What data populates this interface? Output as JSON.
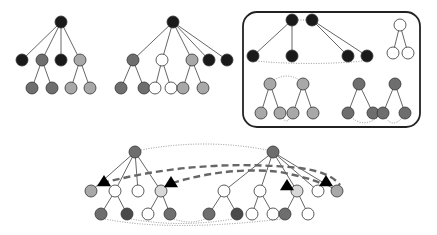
{
  "colors": {
    "black": "#1a1a1a",
    "dark": "#4a4a4a",
    "mid": "#6e6e6e",
    "light": "#a8a8a8",
    "pale": "#d8d8d8",
    "white": "#ffffff"
  },
  "diagram": {
    "tree1": {
      "nodes": [
        {
          "id": "r",
          "x": 61,
          "y": 22,
          "c": "black"
        },
        {
          "id": "a",
          "x": 22,
          "y": 60,
          "c": "black"
        },
        {
          "id": "b",
          "x": 42,
          "y": 60,
          "c": "mid"
        },
        {
          "id": "c",
          "x": 61,
          "y": 60,
          "c": "black"
        },
        {
          "id": "d",
          "x": 80,
          "y": 60,
          "c": "light"
        },
        {
          "id": "b1",
          "x": 32,
          "y": 88,
          "c": "mid"
        },
        {
          "id": "b2",
          "x": 52,
          "y": 88,
          "c": "mid"
        },
        {
          "id": "d1",
          "x": 71,
          "y": 88,
          "c": "light"
        },
        {
          "id": "d2",
          "x": 90,
          "y": 88,
          "c": "light"
        }
      ],
      "edges": [
        [
          "r",
          "a"
        ],
        [
          "r",
          "b"
        ],
        [
          "r",
          "c"
        ],
        [
          "r",
          "d"
        ],
        [
          "b",
          "b1"
        ],
        [
          "b",
          "b2"
        ],
        [
          "d",
          "d1"
        ],
        [
          "d",
          "d2"
        ]
      ]
    },
    "tree2": {
      "nodes": [
        {
          "id": "r",
          "x": 173,
          "y": 22,
          "c": "black"
        },
        {
          "id": "a",
          "x": 133,
          "y": 60,
          "c": "mid"
        },
        {
          "id": "b",
          "x": 162,
          "y": 60,
          "c": "white"
        },
        {
          "id": "c",
          "x": 192,
          "y": 60,
          "c": "light"
        },
        {
          "id": "d",
          "x": 209,
          "y": 60,
          "c": "black"
        },
        {
          "id": "e",
          "x": 227,
          "y": 60,
          "c": "black"
        },
        {
          "id": "a1",
          "x": 121,
          "y": 88,
          "c": "mid"
        },
        {
          "id": "a2",
          "x": 144,
          "y": 88,
          "c": "mid"
        },
        {
          "id": "b1",
          "x": 155,
          "y": 88,
          "c": "white"
        },
        {
          "id": "b2",
          "x": 171,
          "y": 88,
          "c": "white"
        },
        {
          "id": "c1",
          "x": 183,
          "y": 88,
          "c": "light"
        },
        {
          "id": "c2",
          "x": 203,
          "y": 88,
          "c": "light"
        }
      ],
      "edges": [
        [
          "r",
          "a"
        ],
        [
          "r",
          "b"
        ],
        [
          "r",
          "c"
        ],
        [
          "r",
          "d"
        ],
        [
          "r",
          "e"
        ],
        [
          "a",
          "a1"
        ],
        [
          "a",
          "a2"
        ],
        [
          "b",
          "b1"
        ],
        [
          "b",
          "b2"
        ],
        [
          "c",
          "c1"
        ],
        [
          "c",
          "c2"
        ]
      ]
    },
    "panel": {
      "box": {
        "x": 243,
        "y": 12,
        "w": 177,
        "h": 115,
        "r": 14
      },
      "nodes": [
        {
          "id": "p1",
          "x": 292,
          "y": 20,
          "c": "black"
        },
        {
          "id": "p2",
          "x": 312,
          "y": 20,
          "c": "black"
        },
        {
          "id": "q1",
          "x": 253,
          "y": 56,
          "c": "black"
        },
        {
          "id": "q2",
          "x": 292,
          "y": 56,
          "c": "black"
        },
        {
          "id": "q3",
          "x": 348,
          "y": 56,
          "c": "black"
        },
        {
          "id": "q4",
          "x": 367,
          "y": 56,
          "c": "black"
        },
        {
          "id": "w0",
          "x": 400,
          "y": 25,
          "c": "white"
        },
        {
          "id": "w1",
          "x": 393,
          "y": 53,
          "c": "white"
        },
        {
          "id": "w2",
          "x": 408,
          "y": 53,
          "c": "white"
        },
        {
          "id": "g1",
          "x": 270,
          "y": 84,
          "c": "light"
        },
        {
          "id": "g2",
          "x": 303,
          "y": 84,
          "c": "light"
        },
        {
          "id": "g11",
          "x": 261,
          "y": 113,
          "c": "light"
        },
        {
          "id": "g12",
          "x": 280,
          "y": 113,
          "c": "light"
        },
        {
          "id": "g21",
          "x": 293,
          "y": 113,
          "c": "light"
        },
        {
          "id": "g22",
          "x": 313,
          "y": 113,
          "c": "light"
        },
        {
          "id": "h1",
          "x": 359,
          "y": 84,
          "c": "mid"
        },
        {
          "id": "h2",
          "x": 395,
          "y": 84,
          "c": "mid"
        },
        {
          "id": "h11",
          "x": 348,
          "y": 113,
          "c": "mid"
        },
        {
          "id": "h12",
          "x": 373,
          "y": 113,
          "c": "mid"
        },
        {
          "id": "h21",
          "x": 383,
          "y": 113,
          "c": "mid"
        },
        {
          "id": "h22",
          "x": 405,
          "y": 113,
          "c": "mid"
        }
      ],
      "edges": [
        [
          "p1",
          "q1"
        ],
        [
          "p1",
          "q2"
        ],
        [
          "p2",
          "q3"
        ],
        [
          "p2",
          "q4"
        ],
        [
          "w0",
          "w1"
        ],
        [
          "w0",
          "w2"
        ],
        [
          "g1",
          "g11"
        ],
        [
          "g1",
          "g12"
        ],
        [
          "g2",
          "g21"
        ],
        [
          "g2",
          "g22"
        ],
        [
          "h1",
          "h11"
        ],
        [
          "h1",
          "h12"
        ],
        [
          "h2",
          "h21"
        ],
        [
          "h2",
          "h22"
        ]
      ],
      "dotted": [
        {
          "d": "M 298 20 L 306 20"
        },
        {
          "d": "M 256 61 Q 310 66 363 61"
        },
        {
          "d": "M 274 80 Q 287 72 299 80"
        },
        {
          "d": "M 283 118 Q 286 124 290 118"
        },
        {
          "d": "M 351 117 Q 363 128 377 118"
        },
        {
          "d": "M 386 118 Q 393 128 402 118"
        }
      ]
    },
    "bottom": {
      "nodes": [
        {
          "id": "R1",
          "x": 135,
          "y": 152,
          "c": "mid"
        },
        {
          "id": "R2",
          "x": 273,
          "y": 152,
          "c": "mid"
        },
        {
          "id": "a",
          "x": 91,
          "y": 191,
          "c": "light"
        },
        {
          "id": "b",
          "x": 115,
          "y": 191,
          "c": "white"
        },
        {
          "id": "c",
          "x": 138,
          "y": 191,
          "c": "white"
        },
        {
          "id": "d",
          "x": 161,
          "y": 191,
          "c": "pale"
        },
        {
          "id": "e",
          "x": 224,
          "y": 191,
          "c": "white"
        },
        {
          "id": "f",
          "x": 260,
          "y": 191,
          "c": "white"
        },
        {
          "id": "g",
          "x": 297,
          "y": 191,
          "c": "pale"
        },
        {
          "id": "h",
          "x": 318,
          "y": 191,
          "c": "white"
        },
        {
          "id": "i",
          "x": 337,
          "y": 191,
          "c": "light"
        },
        {
          "id": "b1",
          "x": 101,
          "y": 214,
          "c": "mid"
        },
        {
          "id": "b2",
          "x": 127,
          "y": 214,
          "c": "dark"
        },
        {
          "id": "d1",
          "x": 148,
          "y": 214,
          "c": "white"
        },
        {
          "id": "d2",
          "x": 170,
          "y": 214,
          "c": "mid"
        },
        {
          "id": "e1",
          "x": 209,
          "y": 214,
          "c": "mid"
        },
        {
          "id": "e2",
          "x": 237,
          "y": 214,
          "c": "dark"
        },
        {
          "id": "f1",
          "x": 252,
          "y": 214,
          "c": "white"
        },
        {
          "id": "f2",
          "x": 273,
          "y": 214,
          "c": "white"
        },
        {
          "id": "g1",
          "x": 285,
          "y": 214,
          "c": "mid"
        },
        {
          "id": "g2",
          "x": 308,
          "y": 214,
          "c": "white"
        }
      ],
      "edges": [
        [
          "R1",
          "a"
        ],
        [
          "R1",
          "b"
        ],
        [
          "R1",
          "c"
        ],
        [
          "R1",
          "d"
        ],
        [
          "R2",
          "e"
        ],
        [
          "R2",
          "f"
        ],
        [
          "R2",
          "g"
        ],
        [
          "R2",
          "h"
        ],
        [
          "R2",
          "i"
        ],
        [
          "b",
          "b1"
        ],
        [
          "b",
          "b2"
        ],
        [
          "d",
          "d1"
        ],
        [
          "d",
          "d2"
        ],
        [
          "e",
          "e1"
        ],
        [
          "e",
          "e2"
        ],
        [
          "f",
          "f1"
        ],
        [
          "f",
          "f2"
        ],
        [
          "g",
          "g1"
        ],
        [
          "g",
          "g2"
        ]
      ],
      "dotted": [
        {
          "d": "M 141 150 Q 205 138 267 150"
        },
        {
          "d": "M 105 219 Q 170 232 282 219"
        },
        {
          "d": "M 131 219 Q 180 228 233 219"
        },
        {
          "d": "M 174 219 Q 190 225 205 219"
        }
      ],
      "dashed": [
        {
          "d": "M 102 183 Q 200 158 300 168 Q 330 172 340 185"
        },
        {
          "d": "M 172 183 Q 230 166 280 172 Q 310 178 320 183"
        }
      ],
      "triangles": [
        {
          "x": 104,
          "y": 182
        },
        {
          "x": 171,
          "y": 183
        },
        {
          "x": 287,
          "y": 186
        },
        {
          "x": 326,
          "y": 182
        }
      ]
    }
  }
}
